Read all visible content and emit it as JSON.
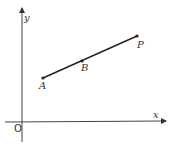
{
  "diagram": {
    "type": "coordinate-geometry",
    "axes": {
      "x_label": "x",
      "y_label": "y",
      "origin_label": "O"
    },
    "points": [
      {
        "label": "A",
        "x": 43,
        "y": 78
      },
      {
        "label": "B",
        "x": 82,
        "y": 61
      },
      {
        "label": "P",
        "x": 137,
        "y": 36
      }
    ],
    "segment": {
      "from": "A",
      "to": "P",
      "through": "B"
    },
    "colors": {
      "line": "#222222",
      "axis": "#444444",
      "background": "#ffffff"
    }
  }
}
